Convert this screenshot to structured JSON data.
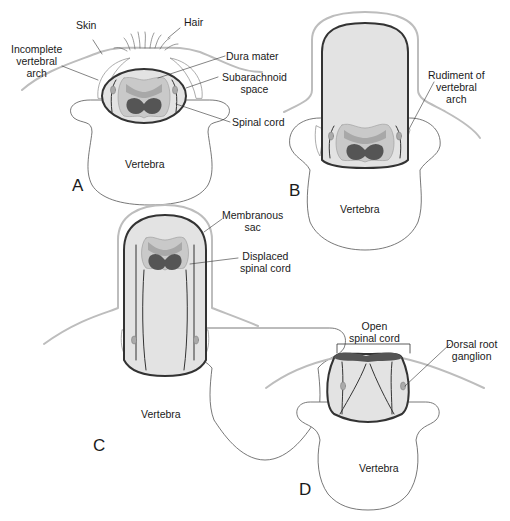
{
  "figure": {
    "panels": [
      {
        "id": "A",
        "letter": "A",
        "labels": {
          "skin": "Skin",
          "hair": "Hair",
          "incomplete_arch": "Incomplete\nvertebral\narch",
          "dura_mater": "Dura mater",
          "subarachnoid": "Subarachnoid\nspace",
          "spinal_cord": "Spinal cord",
          "vertebra": "Vertebra"
        }
      },
      {
        "id": "B",
        "letter": "B",
        "labels": {
          "rudiment": "Rudiment of\nvertebral\narch",
          "vertebra": "Vertebra"
        }
      },
      {
        "id": "C",
        "letter": "C",
        "labels": {
          "membranous_sac": "Membranous\nsac",
          "displaced_cord": "Displaced\nspinal cord",
          "vertebra": "Vertebra"
        }
      },
      {
        "id": "D",
        "letter": "D",
        "labels": {
          "open_cord": "Open\nspinal cord",
          "drg": "Dorsal root\nganglion",
          "vertebra": "Vertebra"
        }
      }
    ],
    "colors": {
      "outline": "#333333",
      "skin": "#bdbdbd",
      "csf": "#e3e3e3",
      "white_matter": "#c9c9c9",
      "gray_light": "#a8a8a8",
      "gray_dark": "#555555"
    }
  }
}
